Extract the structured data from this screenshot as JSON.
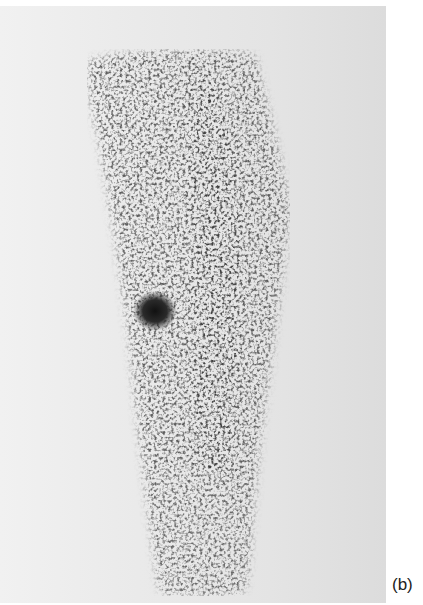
{
  "figure": {
    "panel_label": "(b)",
    "colors": {
      "background": "#e6e6e6",
      "speckle": "#5a5a5a",
      "hotspot": "#1a1a1a"
    }
  }
}
